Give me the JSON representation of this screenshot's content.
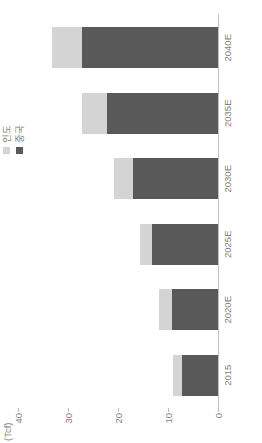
{
  "chart_data": {
    "type": "bar",
    "stacked": true,
    "orientation": "vertical",
    "title": "",
    "subtitle": "",
    "unit_label": "(Tcf)",
    "xlabel": "",
    "ylabel": "",
    "categories": [
      "2015",
      "2020E",
      "2025E",
      "2030E",
      "2035E",
      "2040E"
    ],
    "series": [
      {
        "name": "중국",
        "color": "#595959",
        "values": [
          7.2,
          9.3,
          13.2,
          17.1,
          22.3,
          27.2
        ]
      },
      {
        "name": "인도",
        "color": "#d4d4d4",
        "values": [
          1.9,
          2.5,
          2.5,
          3.7,
          5.0,
          6.0
        ]
      }
    ],
    "totals": [
      9.1,
      11.8,
      15.7,
      20.8,
      27.3,
      33.2
    ],
    "ylim": [
      0,
      40
    ],
    "yticks": [
      0,
      10,
      20,
      30,
      40
    ],
    "ytick_labels": [
      "0",
      "10",
      "20",
      "30",
      "40"
    ],
    "grid": false,
    "legend_position": "top-right",
    "legend": [
      "인도",
      "중국"
    ]
  },
  "colors": {
    "series_dark": "#595959",
    "series_light": "#d4d4d4",
    "axis": "#bfbfbf",
    "text": "#7f7f7f",
    "background": "#ffffff"
  }
}
